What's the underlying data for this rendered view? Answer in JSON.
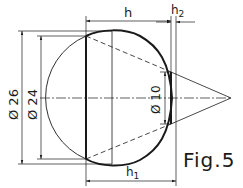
{
  "figure": {
    "caption": "Fig.5",
    "colors": {
      "line": "#1a1a1a",
      "background": "#ffffff"
    }
  },
  "dimensions": {
    "h": "h",
    "h2": "h",
    "h2_sub": "2",
    "h1": "h",
    "h1_sub": "1",
    "dia_outer": "Ø 26",
    "dia_inner": "Ø 24",
    "dia_cone": "Ø 10"
  }
}
